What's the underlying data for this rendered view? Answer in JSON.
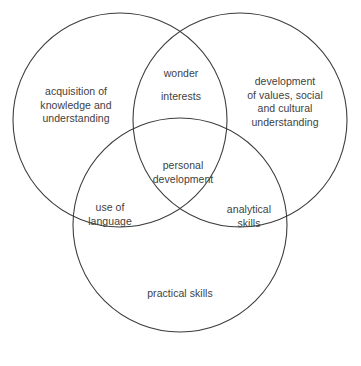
{
  "diagram": {
    "type": "venn",
    "title": "",
    "background_color": "#ffffff",
    "stroke_color": "#3c3c3c",
    "text_color": "#414141",
    "circles": [
      {
        "name": "top-left-circle",
        "cx": 120,
        "cy": 120,
        "r": 107
      },
      {
        "name": "top-right-circle",
        "cx": 240,
        "cy": 120,
        "r": 107
      },
      {
        "name": "bottom-circle",
        "cx": 180,
        "cy": 225,
        "r": 107
      }
    ],
    "labels": {
      "top_left": "acquisition of\nknowledge and\nunderstanding",
      "top_right": "development\nof values, social\nand cultural\nunderstanding",
      "bottom": "practical skills",
      "top_overlap_first": "wonder",
      "top_overlap_second": "interests",
      "left_overlap": "use of\nlanguage",
      "right_overlap": "analytical\nskills",
      "center": "personal\ndevelopment"
    }
  }
}
